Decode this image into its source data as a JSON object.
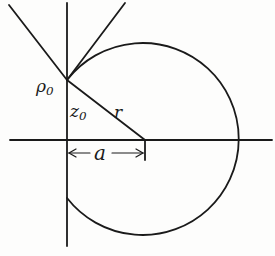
{
  "diagram": {
    "type": "geometric-figure",
    "colors": {
      "stroke": "#1a1a1a",
      "background": "#fdfdfc"
    },
    "labels": {
      "rho0": {
        "base": "ρ",
        "sub": "0"
      },
      "z0": {
        "base": "z",
        "sub": "0"
      },
      "r": "r",
      "a": "a"
    },
    "geometry": {
      "vertical_axis_x": 67,
      "horizontal_axis_y": 140,
      "circle_center": [
        145,
        140
      ],
      "circle_radius": 96,
      "point_p0": [
        67,
        80
      ]
    }
  }
}
